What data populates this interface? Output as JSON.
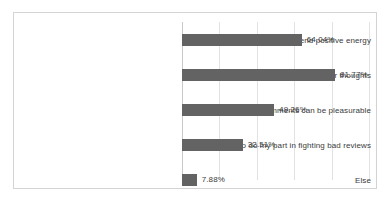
{
  "chart_data": {
    "type": "bar",
    "orientation": "horizontal",
    "title": "",
    "subtitle": "",
    "xlabel": "",
    "ylabel": "",
    "xlim": [
      0,
      100
    ],
    "grid": true,
    "gridlines": [
      0,
      20,
      40,
      60,
      80,
      100
    ],
    "legend": false,
    "legend_position": "none",
    "value_labels": true,
    "value_label_format": "percent-2dp",
    "bar_color": "#636363",
    "grid_color": "#e2e2e2",
    "axis_color": "#c9c9c9",
    "border_color": "#d4d4d4",
    "text_color": "#3b3b3b",
    "background": "#ffffff",
    "categories": [
      "To send positive energy",
      "To express your thoughts",
      "Altruistic comments can be pleasurable",
      "To do my part in fighting bad reviews",
      "Else"
    ],
    "values": [
      64.04,
      81.77,
      49.26,
      32.51,
      7.88
    ],
    "value_labels_text": [
      "64.04%",
      "81.77%",
      "49.26%",
      "32.51%",
      "7.88%"
    ],
    "series": [
      {
        "name": "",
        "values": [
          64.04,
          81.77,
          49.26,
          32.51,
          7.88
        ]
      }
    ]
  }
}
